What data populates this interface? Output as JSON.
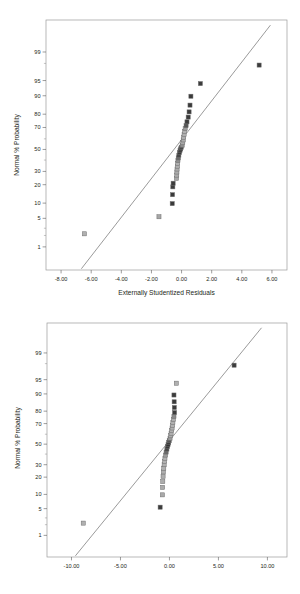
{
  "figures": [
    {
      "id": "normal-plot-externally-studentized-residuals",
      "chart_data": {
        "type": "scatter",
        "title": "",
        "xlabel": "Externally Studentized Residuals",
        "ylabel": "Normal % Probability",
        "xlim": [
          -9.0,
          7.0
        ],
        "ylim_probability": [
          0.2,
          99.9
        ],
        "grid": false,
        "legend": "none",
        "xticks": [
          "-8.00",
          "-6.00",
          "-4.00",
          "-2.00",
          "0.00",
          "2.00",
          "4.00",
          "6.00"
        ],
        "xtick_values": [
          -8,
          -6,
          -4,
          -2,
          0,
          2,
          4,
          6
        ],
        "yticks": [
          "1",
          "5",
          "10",
          "20",
          "30",
          "50",
          "70",
          "80",
          "90",
          "95",
          "99"
        ],
        "ytick_values": [
          1,
          5,
          10,
          20,
          30,
          50,
          70,
          80,
          90,
          95,
          99
        ],
        "reference_line": {
          "x1": -6.65,
          "y1": 0.22,
          "x2": 5.9,
          "y2": 99.85
        },
        "series": [
          {
            "name": "Externally Studentized Residuals",
            "points": [
              {
                "x": -6.45,
                "p": 2.2,
                "shade": "#b0b0b0"
              },
              {
                "x": -1.5,
                "p": 5.4,
                "shade": "#a6a6a6"
              },
              {
                "x": -0.62,
                "p": 9.8,
                "shade": "#3a3a3a"
              },
              {
                "x": -0.6,
                "p": 14.0,
                "shade": "#3a3a3a"
              },
              {
                "x": -0.58,
                "p": 18.6,
                "shade": "#3c3c3c"
              },
              {
                "x": -0.56,
                "p": 21.0,
                "shade": "#3c3c3c"
              },
              {
                "x": -0.34,
                "p": 24.5,
                "shade": "#a8a8a8"
              },
              {
                "x": -0.32,
                "p": 27.0,
                "shade": "#aaaaaa"
              },
              {
                "x": -0.31,
                "p": 29.5,
                "shade": "#acacac"
              },
              {
                "x": -0.3,
                "p": 32.0,
                "shade": "#adadad"
              },
              {
                "x": -0.28,
                "p": 34.5,
                "shade": "#aeaeae"
              },
              {
                "x": -0.26,
                "p": 37.0,
                "shade": "#b0b0b0"
              },
              {
                "x": -0.24,
                "p": 39.5,
                "shade": "#909090"
              },
              {
                "x": -0.22,
                "p": 42.0,
                "shade": "#6a6a6a"
              },
              {
                "x": -0.18,
                "p": 44.5,
                "shade": "#474747"
              },
              {
                "x": -0.14,
                "p": 47.0,
                "shade": "#3a3a3a"
              },
              {
                "x": -0.1,
                "p": 49.0,
                "shade": "#333333"
              },
              {
                "x": -0.06,
                "p": 50.5,
                "shade": "#3a3a3a"
              },
              {
                "x": -0.02,
                "p": 52.0,
                "shade": "#4a4a4a"
              },
              {
                "x": 0.04,
                "p": 54.0,
                "shade": "#8e8e8e"
              },
              {
                "x": 0.08,
                "p": 56.5,
                "shade": "#a8a8a8"
              },
              {
                "x": 0.11,
                "p": 59.0,
                "shade": "#acacac"
              },
              {
                "x": 0.14,
                "p": 61.5,
                "shade": "#aeaeae"
              },
              {
                "x": 0.17,
                "p": 64.0,
                "shade": "#b0b0b0"
              },
              {
                "x": 0.2,
                "p": 66.5,
                "shade": "#b1b1b1"
              },
              {
                "x": 0.24,
                "p": 69.0,
                "shade": "#9a9a9a"
              },
              {
                "x": 0.3,
                "p": 71.5,
                "shade": "#555555"
              },
              {
                "x": 0.36,
                "p": 74.5,
                "shade": "#3c3c3c"
              },
              {
                "x": 0.44,
                "p": 78.0,
                "shade": "#3a3a3a"
              },
              {
                "x": 0.5,
                "p": 81.5,
                "shade": "#3a3a3a"
              },
              {
                "x": 0.56,
                "p": 85.5,
                "shade": "#3a3a3a"
              },
              {
                "x": 0.62,
                "p": 89.8,
                "shade": "#3a3a3a"
              },
              {
                "x": 1.25,
                "p": 94.2,
                "shade": "#3c3c3c"
              },
              {
                "x": 5.15,
                "p": 97.8,
                "shade": "#3c3c3c"
              }
            ]
          }
        ]
      }
    },
    {
      "id": "normal-plot-residuals-secondary",
      "chart_data": {
        "type": "scatter",
        "title": "",
        "xlabel": "",
        "ylabel": "Normal % Probability",
        "xlim": [
          -12.5,
          12.0
        ],
        "ylim_probability": [
          0.2,
          99.9
        ],
        "grid": false,
        "legend": "none",
        "xticks": [
          "-10.00",
          "-5.00",
          "0.00",
          "5.00",
          "10.00"
        ],
        "xtick_values": [
          -10,
          -5,
          0,
          5,
          10
        ],
        "yticks": [
          "1",
          "5",
          "10",
          "20",
          "30",
          "50",
          "70",
          "80",
          "90",
          "95",
          "99"
        ],
        "ytick_values": [
          1,
          5,
          10,
          20,
          30,
          50,
          70,
          80,
          90,
          95,
          99
        ],
        "reference_line": {
          "x1": -9.6,
          "y1": 0.22,
          "x2": 9.4,
          "y2": 99.85
        },
        "series": [
          {
            "name": "Residuals",
            "points": [
              {
                "x": -8.8,
                "p": 2.2,
                "shade": "#b0b0b0"
              },
              {
                "x": -0.95,
                "p": 5.4,
                "shade": "#3c3c3c"
              },
              {
                "x": -0.72,
                "p": 9.8,
                "shade": "#a9a9a9"
              },
              {
                "x": -0.7,
                "p": 13.5,
                "shade": "#aaaaaa"
              },
              {
                "x": -0.68,
                "p": 17.0,
                "shade": "#acacac"
              },
              {
                "x": -0.65,
                "p": 20.5,
                "shade": "#adadad"
              },
              {
                "x": -0.62,
                "p": 24.0,
                "shade": "#aeaeae"
              },
              {
                "x": -0.58,
                "p": 27.0,
                "shade": "#b0b0b0"
              },
              {
                "x": -0.54,
                "p": 30.0,
                "shade": "#b0b0b0"
              },
              {
                "x": -0.5,
                "p": 33.0,
                "shade": "#b1b1b1"
              },
              {
                "x": -0.46,
                "p": 36.0,
                "shade": "#b1b1b1"
              },
              {
                "x": -0.4,
                "p": 39.0,
                "shade": "#9a9a9a"
              },
              {
                "x": -0.34,
                "p": 42.0,
                "shade": "#6a6a6a"
              },
              {
                "x": -0.26,
                "p": 45.0,
                "shade": "#484848"
              },
              {
                "x": -0.2,
                "p": 47.5,
                "shade": "#3a3a3a"
              },
              {
                "x": -0.14,
                "p": 49.5,
                "shade": "#333333"
              },
              {
                "x": -0.08,
                "p": 51.5,
                "shade": "#3c3c3c"
              },
              {
                "x": -0.02,
                "p": 53.5,
                "shade": "#555555"
              },
              {
                "x": 0.06,
                "p": 56.0,
                "shade": "#9a9a9a"
              },
              {
                "x": 0.12,
                "p": 58.5,
                "shade": "#acacac"
              },
              {
                "x": 0.17,
                "p": 61.0,
                "shade": "#aeaeae"
              },
              {
                "x": 0.22,
                "p": 63.5,
                "shade": "#b0b0b0"
              },
              {
                "x": 0.27,
                "p": 66.0,
                "shade": "#b0b0b0"
              },
              {
                "x": 0.31,
                "p": 68.5,
                "shade": "#b1b1b1"
              },
              {
                "x": 0.35,
                "p": 71.0,
                "shade": "#b1b1b1"
              },
              {
                "x": 0.4,
                "p": 73.5,
                "shade": "#aeaeae"
              },
              {
                "x": 0.46,
                "p": 76.0,
                "shade": "#8a8a8a"
              },
              {
                "x": 0.52,
                "p": 79.0,
                "shade": "#3c3c3c"
              },
              {
                "x": 0.5,
                "p": 82.5,
                "shade": "#3a3a3a"
              },
              {
                "x": 0.48,
                "p": 86.0,
                "shade": "#3a3a3a"
              },
              {
                "x": 0.46,
                "p": 89.5,
                "shade": "#3a3a3a"
              },
              {
                "x": 0.7,
                "p": 94.0,
                "shade": "#b0b0b0"
              },
              {
                "x": 6.6,
                "p": 97.8,
                "shade": "#3c3c3c"
              }
            ]
          }
        ]
      }
    }
  ]
}
